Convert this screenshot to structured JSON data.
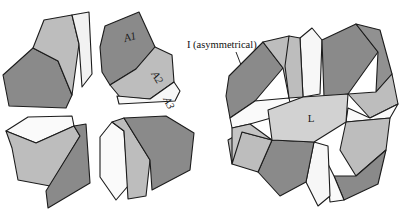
{
  "figure": {
    "background_color": "#ffffff",
    "stroke_color": "#1c1c1c",
    "palette": {
      "dark_gray": "#8a8a8a",
      "mid_gray": "#a0a0a0",
      "light_gray": "#bdbdbd",
      "pale_gray": "#d2d2d2",
      "near_white": "#f2f2f2",
      "white": "#fdfdfd",
      "marker": "#0a0a0a"
    },
    "annotations": {
      "asymmetrical_label": "I (asymmetrical)",
      "center_label": "L"
    },
    "left_figure": {
      "name": "exploded-cluster-arrangement",
      "cluster_count": 4,
      "pieces_per_cluster": 3,
      "piece_labels": [
        "A1",
        "A2",
        "A3"
      ],
      "center_gap": "circular"
    },
    "right_figure": {
      "name": "assembled-rosette",
      "arm_count": 5,
      "center_shape": "pentagon",
      "center_label": "L"
    }
  }
}
